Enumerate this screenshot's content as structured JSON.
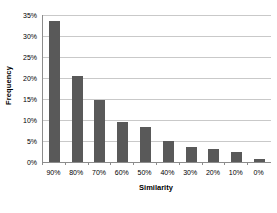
{
  "chart_data": {
    "type": "bar",
    "title": "",
    "xlabel": "Similarity",
    "ylabel": "Frequency",
    "categories": [
      "90%",
      "80%",
      "70%",
      "60%",
      "50%",
      "40%",
      "30%",
      "20%",
      "10%",
      "0%"
    ],
    "values": [
      33.6,
      20.4,
      14.8,
      9.6,
      8.4,
      5.0,
      3.5,
      3.0,
      2.3,
      0.6
    ],
    "series": [
      {
        "name": "Frequency",
        "values": [
          33.6,
          20.4,
          14.8,
          9.6,
          8.4,
          5.0,
          3.5,
          3.0,
          2.3,
          0.6
        ]
      }
    ],
    "ylim": [
      0,
      35
    ],
    "ytick_labels": [
      "0%",
      "5%",
      "10%",
      "15%",
      "20%",
      "25%",
      "30%",
      "35%"
    ],
    "ytick_values": [
      0,
      5,
      10,
      15,
      20,
      25,
      30,
      35
    ],
    "grid": true,
    "gridline_axis": "y",
    "legend": false,
    "legend_position": "none",
    "bar_color": "#595959",
    "gridline_color": "#c9c9c9",
    "axis_color": "#8c8c8c",
    "background_color": "#ffffff",
    "value_unit": "%"
  }
}
